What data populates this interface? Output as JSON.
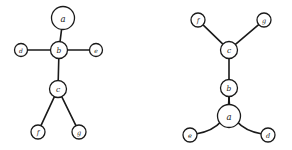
{
  "figure": {
    "background_color": "#ffffff",
    "stroke_color": "#1a1a1a",
    "node_fill_color": "#ffffff",
    "width": 292,
    "height": 150
  },
  "graphs": [
    {
      "id": "left-graph",
      "name": "left-tree-diagram",
      "nodes": [
        {
          "id": "a",
          "label": "a",
          "cx": 63,
          "cy": 18,
          "r": 11.5,
          "font_size": 8.5
        },
        {
          "id": "b",
          "label": "b",
          "cx": 59,
          "cy": 50,
          "r": 8.5,
          "font_size": 7.5
        },
        {
          "id": "d",
          "label": "d",
          "cx": 21,
          "cy": 50,
          "r": 6.5,
          "font_size": 6
        },
        {
          "id": "e",
          "label": "e",
          "cx": 96,
          "cy": 50,
          "r": 6.5,
          "font_size": 6
        },
        {
          "id": "c",
          "label": "c",
          "cx": 58,
          "cy": 89,
          "r": 8.5,
          "font_size": 7.5
        },
        {
          "id": "f",
          "label": "f",
          "cx": 38,
          "cy": 132,
          "r": 7,
          "font_size": 6.5
        },
        {
          "id": "g",
          "label": "g",
          "cx": 79,
          "cy": 132,
          "r": 7,
          "font_size": 6.5
        }
      ],
      "edges": [
        {
          "id": "a-b",
          "from": "a",
          "to": "b",
          "type": "straight"
        },
        {
          "id": "d-b",
          "from": "d",
          "to": "b",
          "type": "straight"
        },
        {
          "id": "b-e",
          "from": "b",
          "to": "e",
          "type": "straight"
        },
        {
          "id": "b-c",
          "from": "b",
          "to": "c",
          "type": "straight"
        },
        {
          "id": "c-f",
          "from": "c",
          "to": "f",
          "type": "straight"
        },
        {
          "id": "c-g",
          "from": "c",
          "to": "g",
          "type": "straight"
        }
      ]
    },
    {
      "id": "right-graph",
      "name": "right-tree-diagram",
      "nodes": [
        {
          "id": "f",
          "label": "f",
          "cx": 198,
          "cy": 20,
          "r": 7,
          "font_size": 6.5
        },
        {
          "id": "g",
          "label": "g",
          "cx": 264,
          "cy": 20,
          "r": 7,
          "font_size": 6.5
        },
        {
          "id": "c",
          "label": "c",
          "cx": 229,
          "cy": 50,
          "r": 8.5,
          "font_size": 7.5
        },
        {
          "id": "b",
          "label": "b",
          "cx": 229,
          "cy": 88,
          "r": 8.5,
          "font_size": 7.5
        },
        {
          "id": "a",
          "label": "a",
          "cx": 229,
          "cy": 116,
          "r": 11.5,
          "font_size": 8.5
        },
        {
          "id": "e",
          "label": "e",
          "cx": 190,
          "cy": 135,
          "r": 7,
          "font_size": 6.5
        },
        {
          "id": "d",
          "label": "d",
          "cx": 268,
          "cy": 135,
          "r": 7,
          "font_size": 6.5
        }
      ],
      "edges": [
        {
          "id": "f-c",
          "from": "f",
          "to": "c",
          "type": "straight"
        },
        {
          "id": "g-c",
          "from": "g",
          "to": "c",
          "type": "straight"
        },
        {
          "id": "c-b",
          "from": "c",
          "to": "b",
          "type": "straight"
        },
        {
          "id": "b-a",
          "from": "b",
          "to": "a",
          "type": "straight"
        },
        {
          "id": "b-e",
          "from": "b",
          "to": "e",
          "type": "curved",
          "bow": -1
        },
        {
          "id": "b-d",
          "from": "b",
          "to": "d",
          "type": "curved",
          "bow": 1
        }
      ]
    }
  ]
}
